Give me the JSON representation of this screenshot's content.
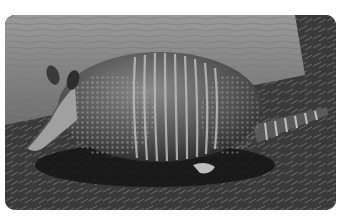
{
  "image": {
    "subject": "armadillo",
    "description": "Grayscale photograph of a nine-banded armadillo walking left in front of a fallen log on leaf-litter ground",
    "colors": {
      "background": "#ffffff",
      "log": "#8a8a8a",
      "ground": "#3c3c3c",
      "shell": "#5a5a5a",
      "band_highlight": "#b8b8b8",
      "shadow": "#141414"
    }
  }
}
